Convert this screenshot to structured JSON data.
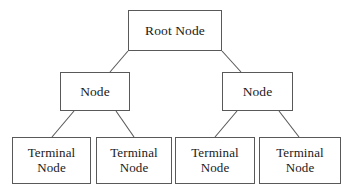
{
  "diagram": {
    "background_color": "#ffffff",
    "border_color": "#595959",
    "text_color": "#1a1a1a",
    "edge_color": "#595959",
    "nodes": {
      "root": {
        "label": "Root Node"
      },
      "left": {
        "label": "Node"
      },
      "right": {
        "label": "Node"
      },
      "terminal_1": {
        "label": "Terminal\nNode"
      },
      "terminal_2": {
        "label": "Terminal\nNode"
      },
      "terminal_3": {
        "label": "Terminal\nNode"
      },
      "terminal_4": {
        "label": "Terminal\nNode"
      }
    },
    "edges": [
      {
        "name": "root-to-left-node",
        "x1": 128,
        "y1": 51,
        "x2": 110,
        "y2": 72
      },
      {
        "name": "root-to-right-node",
        "x1": 222,
        "y1": 51,
        "x2": 241,
        "y2": 72
      },
      {
        "name": "left-node-to-terminal-1",
        "x1": 74,
        "y1": 111,
        "x2": 52,
        "y2": 137
      },
      {
        "name": "left-node-to-terminal-2",
        "x1": 116,
        "y1": 111,
        "x2": 134,
        "y2": 137
      },
      {
        "name": "right-node-to-terminal-3",
        "x1": 237,
        "y1": 111,
        "x2": 215,
        "y2": 137
      },
      {
        "name": "right-node-to-terminal-4",
        "x1": 279,
        "y1": 111,
        "x2": 299,
        "y2": 137
      }
    ]
  }
}
